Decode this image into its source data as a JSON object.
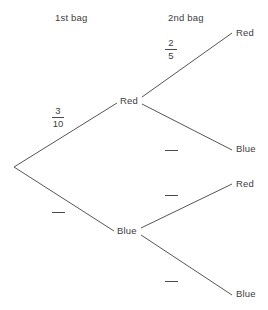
{
  "diagram": {
    "type": "probability-tree-diagram",
    "background_color": "#ffffff",
    "line_color": "#555555",
    "text_color": "#3c3c3c",
    "headers": {
      "stage1": "1st bag",
      "stage2": "2nd bag"
    },
    "nodes": {
      "stage1": {
        "red": "Red",
        "blue": "Blue"
      },
      "stage2": {
        "red_then_red": "Red",
        "red_then_blue": "Blue",
        "blue_then_red": "Red",
        "blue_then_blue": "Blue"
      }
    },
    "branch_labels": {
      "stage1_red": {
        "numerator": "3",
        "denominator": "10",
        "blank": false
      },
      "stage1_blue": {
        "numerator": "",
        "denominator": "",
        "blank": true
      },
      "stage2_red_red": {
        "numerator": "2",
        "denominator": "5",
        "blank": false
      },
      "stage2_red_blue": {
        "numerator": "",
        "denominator": "",
        "blank": true
      },
      "stage2_blue_red": {
        "numerator": "",
        "denominator": "",
        "blank": true
      },
      "stage2_blue_blue": {
        "numerator": "",
        "denominator": "",
        "blank": true
      }
    },
    "edges": [
      {
        "name": "root-to-red",
        "x1": 14,
        "y1": 167,
        "x2": 117,
        "y2": 103
      },
      {
        "name": "root-to-blue",
        "x1": 14,
        "y1": 167,
        "x2": 114,
        "y2": 231
      },
      {
        "name": "red-to-red",
        "x1": 142,
        "y1": 97,
        "x2": 232,
        "y2": 33
      },
      {
        "name": "red-to-blue",
        "x1": 142,
        "y1": 104,
        "x2": 232,
        "y2": 150
      },
      {
        "name": "blue-to-red",
        "x1": 141,
        "y1": 228,
        "x2": 232,
        "y2": 184
      },
      {
        "name": "blue-to-blue",
        "x1": 141,
        "y1": 235,
        "x2": 232,
        "y2": 295
      }
    ]
  }
}
